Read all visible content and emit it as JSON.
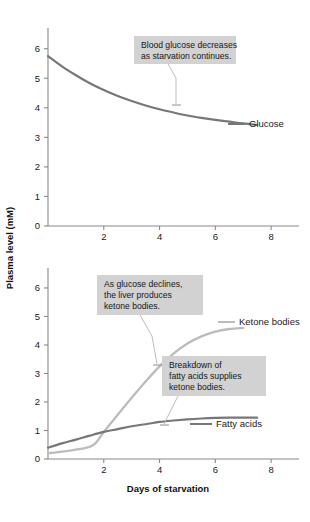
{
  "figure": {
    "colors": {
      "glucose_line": "#777777",
      "fatty_acids_line": "#777777",
      "ketone_line": "#bcbcbc",
      "axis": "#8a8a8a",
      "callout_background": "#d2d2d2",
      "leader_line": "#b4b4b4",
      "text": "#1a1a1a",
      "background": "#ffffff"
    },
    "shared_axis_label_y": "Plasma level (mM)",
    "shared_axis_label_x": "Days of starvation"
  },
  "chart_data": [
    {
      "type": "line",
      "id": "glucose-chart",
      "title": "",
      "xlabel": "",
      "ylabel": "Plasma level (mM)",
      "xlim": [
        0,
        9
      ],
      "ylim": [
        0,
        6.7
      ],
      "xticks": [
        2,
        4,
        6,
        8
      ],
      "yticks": [
        0,
        1,
        2,
        3,
        4,
        5,
        6
      ],
      "xtick_labels": [
        "2",
        "4",
        "6",
        "8"
      ],
      "ytick_labels": [
        "0",
        "1",
        "2",
        "3",
        "4",
        "5",
        "6"
      ],
      "grid": false,
      "legend_position": "inline-right",
      "series": [
        {
          "name": "Glucose",
          "color": "#777777",
          "label": "Glucose",
          "x": [
            0.0,
            0.5,
            1.0,
            1.5,
            2.0,
            2.5,
            3.0,
            3.5,
            4.0,
            4.5,
            5.0,
            5.5,
            6.0,
            6.5,
            7.0,
            7.5
          ],
          "values": [
            5.75,
            5.4,
            5.1,
            4.83,
            4.6,
            4.4,
            4.23,
            4.08,
            3.95,
            3.84,
            3.74,
            3.66,
            3.59,
            3.53,
            3.47,
            3.42
          ]
        }
      ],
      "annotations": [
        {
          "id": "glucose-note",
          "lines": [
            "Blood glucose decreases",
            "as starvation continues."
          ],
          "points_to_x": 4.8,
          "points_to_y": 3.78
        }
      ]
    },
    {
      "type": "line",
      "id": "ketone-fatty-chart",
      "title": "",
      "xlabel": "Days of starvation",
      "ylabel": "Plasma level (mM)",
      "xlim": [
        0,
        9
      ],
      "ylim": [
        0,
        6.7
      ],
      "xticks": [
        2,
        4,
        6,
        8
      ],
      "yticks": [
        0,
        1,
        2,
        3,
        4,
        5,
        6
      ],
      "xtick_labels": [
        "2",
        "4",
        "6",
        "8"
      ],
      "ytick_labels": [
        "0",
        "1",
        "2",
        "3",
        "4",
        "5",
        "6"
      ],
      "grid": false,
      "legend_position": "inline-right",
      "series": [
        {
          "name": "Ketone bodies",
          "color": "#bcbcbc",
          "label": "Ketone bodies",
          "x": [
            0.0,
            0.5,
            1.0,
            1.4,
            1.7,
            2.0,
            2.5,
            3.0,
            3.5,
            4.0,
            4.5,
            5.0,
            5.5,
            6.0,
            6.5,
            7.0
          ],
          "values": [
            0.2,
            0.26,
            0.33,
            0.4,
            0.55,
            0.95,
            1.55,
            2.15,
            2.72,
            3.25,
            3.7,
            4.05,
            4.3,
            4.47,
            4.56,
            4.6
          ]
        },
        {
          "name": "Fatty acids",
          "color": "#777777",
          "label": "Fatty acids",
          "x": [
            0.0,
            0.5,
            1.0,
            1.5,
            2.0,
            2.5,
            3.0,
            3.5,
            4.0,
            4.5,
            5.0,
            5.5,
            6.0,
            6.5,
            7.0,
            7.5
          ],
          "values": [
            0.4,
            0.55,
            0.68,
            0.82,
            0.95,
            1.05,
            1.15,
            1.22,
            1.3,
            1.35,
            1.39,
            1.42,
            1.44,
            1.45,
            1.45,
            1.45
          ]
        }
      ],
      "annotations": [
        {
          "id": "ketone-note",
          "lines": [
            "As glucose declines,",
            "the liver produces",
            "ketone bodies."
          ],
          "points_to_x": 4.4,
          "points_to_y": 3.2
        },
        {
          "id": "fatty-note",
          "lines": [
            "Breakdown of",
            "fatty acids supplies",
            "ketone bodies."
          ],
          "points_to_x": 4.55,
          "points_to_y": 1.36
        }
      ]
    }
  ]
}
